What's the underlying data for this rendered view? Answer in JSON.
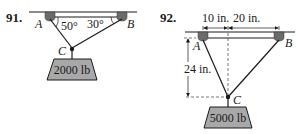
{
  "problems": [
    {
      "number": "91.",
      "points": {
        "a": "A",
        "b": "B",
        "c": "C"
      },
      "angles": {
        "at_a": "50°",
        "at_b": "30°"
      },
      "weight": "2000 lb"
    },
    {
      "number": "92.",
      "points": {
        "a": "A",
        "b": "B",
        "c": "C"
      },
      "dimensions": {
        "horizontal_left": "10 in.",
        "horizontal_right": "20 in.",
        "vertical": "24 in."
      },
      "weight": "5000 lb"
    }
  ],
  "colors": {
    "line": "#1a1a1a",
    "anchor_fill": "#6b6b6b",
    "weight_fill": "#a8a8a8",
    "dashed": "#555555"
  }
}
